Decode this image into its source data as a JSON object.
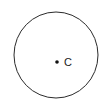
{
  "figure": {
    "type": "geometry-diagram",
    "background_color": "#ffffff",
    "canvas": {
      "width": 108,
      "height": 112
    },
    "circle": {
      "name": "circle-outline",
      "center_x": 56,
      "center_y": 55,
      "radius_x": 42,
      "radius_y": 43,
      "stroke_color": "#2b2b2b",
      "stroke_width": 1,
      "fill": "none"
    },
    "center_point": {
      "name": "center-dot",
      "x": 57,
      "y": 62,
      "radius": 1.8,
      "color": "#111111"
    },
    "center_label": {
      "name": "center-label",
      "text": "C",
      "x": 64,
      "y": 66,
      "color": "#1a1a1a",
      "font_size": 11
    }
  }
}
